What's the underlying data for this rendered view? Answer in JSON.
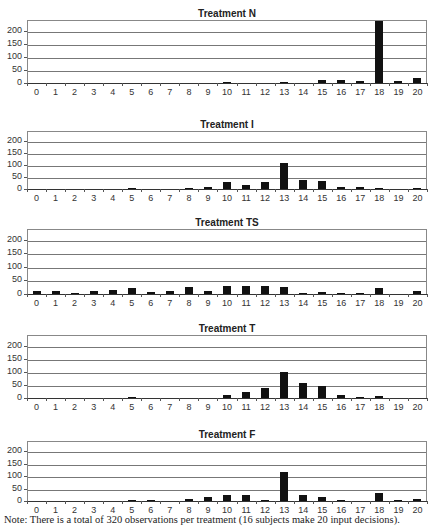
{
  "figure": {
    "note": "Note: There is a total of 320 observations per treatment (16 subjects make 20 input decisions).",
    "y_ticks": [
      "0",
      "50",
      "100",
      "150",
      "200"
    ],
    "x_ticks": [
      "0",
      "1",
      "2",
      "3",
      "4",
      "5",
      "6",
      "7",
      "8",
      "9",
      "10",
      "11",
      "12",
      "13",
      "14",
      "15",
      "16",
      "17",
      "18",
      "19",
      "20"
    ],
    "bar_color": "#111111"
  },
  "chart_data": [
    {
      "type": "bar",
      "title": "Treatment N",
      "categories": [
        0,
        1,
        2,
        3,
        4,
        5,
        6,
        7,
        8,
        9,
        10,
        11,
        12,
        13,
        14,
        15,
        16,
        17,
        18,
        19,
        20
      ],
      "values": [
        0,
        0,
        0,
        0,
        0,
        0,
        0,
        0,
        0,
        0,
        2,
        0,
        0,
        3,
        0,
        10,
        12,
        6,
        235,
        7,
        20
      ],
      "xlabel": "",
      "ylabel": "",
      "ylim": [
        0,
        240
      ],
      "grid": true
    },
    {
      "type": "bar",
      "title": "Treatment I",
      "categories": [
        0,
        1,
        2,
        3,
        4,
        5,
        6,
        7,
        8,
        9,
        10,
        11,
        12,
        13,
        14,
        15,
        16,
        17,
        18,
        19,
        20
      ],
      "values": [
        0,
        0,
        0,
        0,
        0,
        2,
        0,
        0,
        4,
        10,
        27,
        17,
        27,
        108,
        38,
        33,
        8,
        10,
        5,
        0,
        2
      ],
      "xlabel": "",
      "ylabel": "",
      "ylim": [
        0,
        240
      ],
      "grid": true
    },
    {
      "type": "bar",
      "title": "Treatment TS",
      "categories": [
        0,
        1,
        2,
        3,
        4,
        5,
        6,
        7,
        8,
        9,
        10,
        11,
        12,
        13,
        14,
        15,
        16,
        17,
        18,
        19,
        20
      ],
      "values": [
        10,
        10,
        5,
        12,
        15,
        22,
        7,
        12,
        25,
        12,
        30,
        30,
        30,
        27,
        4,
        8,
        4,
        2,
        23,
        0,
        10
      ],
      "xlabel": "",
      "ylabel": "",
      "ylim": [
        0,
        240
      ],
      "grid": true
    },
    {
      "type": "bar",
      "title": "Treatment T",
      "categories": [
        0,
        1,
        2,
        3,
        4,
        5,
        6,
        7,
        8,
        9,
        10,
        11,
        12,
        13,
        14,
        15,
        16,
        17,
        18,
        19,
        20
      ],
      "values": [
        0,
        0,
        0,
        0,
        0,
        3,
        0,
        0,
        0,
        0,
        12,
        22,
        40,
        100,
        58,
        45,
        13,
        4,
        7,
        0,
        0
      ],
      "xlabel": "",
      "ylabel": "",
      "ylim": [
        0,
        240
      ],
      "grid": true
    },
    {
      "type": "bar",
      "title": "Treatment F",
      "categories": [
        0,
        1,
        2,
        3,
        4,
        5,
        6,
        7,
        8,
        9,
        10,
        11,
        12,
        13,
        14,
        15,
        16,
        17,
        18,
        19,
        20
      ],
      "values": [
        0,
        0,
        0,
        0,
        0,
        2,
        6,
        0,
        10,
        18,
        23,
        23,
        5,
        115,
        25,
        15,
        1,
        0,
        32,
        1,
        8
      ],
      "xlabel": "",
      "ylabel": "",
      "ylim": [
        0,
        240
      ],
      "grid": true
    }
  ]
}
